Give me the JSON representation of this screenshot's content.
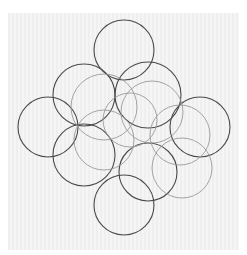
{
  "image": {
    "description": "Line drawing of overlapping circles arranged in a cross/flower pattern on light gray paper",
    "background_color": "#f2f2f2",
    "stroke_dark": "#4a4a4a",
    "stroke_light": "#9a9a9a"
  },
  "circles": [
    {
      "cx": 124,
      "cy": 50,
      "r": 30,
      "tone": "dark"
    },
    {
      "cx": 84,
      "cy": 95,
      "r": 31,
      "tone": "dark"
    },
    {
      "cx": 48,
      "cy": 127,
      "r": 30,
      "tone": "dark"
    },
    {
      "cx": 84,
      "cy": 155,
      "r": 31,
      "tone": "dark"
    },
    {
      "cx": 148,
      "cy": 95,
      "r": 33,
      "tone": "dark"
    },
    {
      "cx": 200,
      "cy": 127,
      "r": 30,
      "tone": "dark"
    },
    {
      "cx": 148,
      "cy": 172,
      "r": 29,
      "tone": "dark"
    },
    {
      "cx": 124,
      "cy": 205,
      "r": 30,
      "tone": "dark"
    },
    {
      "cx": 104,
      "cy": 107,
      "r": 33,
      "tone": "light"
    },
    {
      "cx": 152,
      "cy": 112,
      "r": 31,
      "tone": "light"
    },
    {
      "cx": 180,
      "cy": 135,
      "r": 30,
      "tone": "light"
    },
    {
      "cx": 182,
      "cy": 168,
      "r": 30,
      "tone": "light"
    },
    {
      "cx": 104,
      "cy": 140,
      "r": 30,
      "tone": "light"
    },
    {
      "cx": 130,
      "cy": 120,
      "r": 27,
      "tone": "light"
    }
  ]
}
